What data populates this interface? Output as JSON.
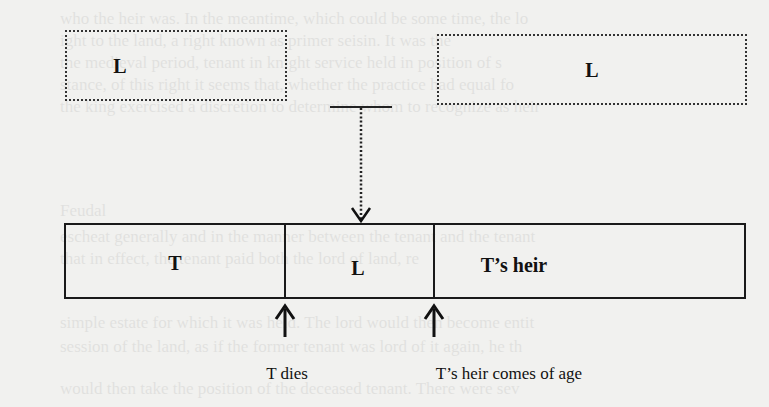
{
  "diagram": {
    "top_boxes": [
      {
        "label": "L",
        "style": "dotted"
      },
      {
        "label": "L",
        "style": "dotted"
      }
    ],
    "connector": {
      "type": "dotted-arrow",
      "from": "T-bar between top boxes",
      "to": "L segment of timeline bar"
    },
    "timeline_bar": {
      "segments": [
        {
          "label": "T"
        },
        {
          "label": "L"
        },
        {
          "label": "T’s heir"
        }
      ]
    },
    "events": [
      {
        "label": "T dies",
        "position": "boundary between T and L"
      },
      {
        "label": "T’s heir comes of age",
        "position": "boundary between L and T’s heir"
      }
    ]
  },
  "background_text": [
    "who the heir was. In the meantime, which could be some time, the lo",
    "ight to the land, a right known as primer seisin. It was the ",
    "the medieval period, tenant in knight service held in position of s",
    "stance, of this right it seems that, whether the practice had equal fo",
    "the king exercised a discretion to determine whom to recognize as heir",
    "Feudal",
    "escheat generally and in the manner between the tenant and the tenant",
    "that in effect, the tenant paid both the lord of land, re",
    "simple estate for which it was held. The lord would then become entit",
    "session of the land, as if the former tenant was lord of it again, he th",
    "would then take the position of the deceased tenant. There were sev"
  ]
}
